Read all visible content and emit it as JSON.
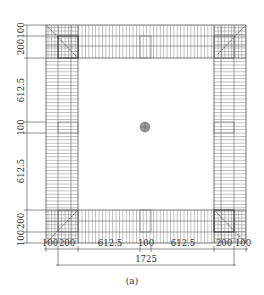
{
  "figure": {
    "caption": "(a)",
    "type": "plan-view mesh diagram",
    "colors": {
      "line": "#555555",
      "grid": "#8a8a8a",
      "text": "#333333",
      "center_marker": "#777777"
    }
  },
  "dimensions": {
    "left_vertical": [
      "100",
      "200",
      "612.5",
      "100",
      "612.5",
      "200",
      "100"
    ],
    "bottom_horizontal": [
      "100",
      "200",
      "612.5",
      "100",
      "612.5",
      "200",
      "100"
    ],
    "total": "1725"
  },
  "elements": {
    "corner_blocks": [
      "top-left",
      "top-right",
      "bottom-left",
      "bottom-right"
    ],
    "mid_blocks": [
      "top-middle",
      "bottom-middle",
      "left-middle",
      "right-middle"
    ],
    "center_marker": "circular-load-point"
  }
}
